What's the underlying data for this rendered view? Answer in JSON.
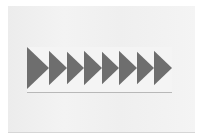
{
  "scene": {
    "description": "Photo of a fabric strip with a row of dark triangles pointing right on a light background",
    "triangle_count": 8,
    "colors": {
      "background": "#f0f0f0",
      "triangle": "#6e6e6e",
      "fabric": "#f4f4f4"
    }
  }
}
